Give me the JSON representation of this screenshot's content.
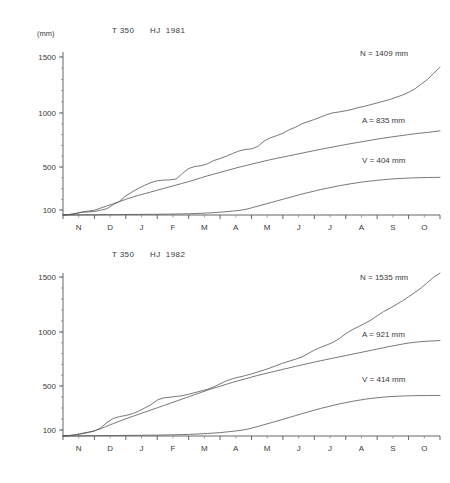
{
  "chart_data": [
    {
      "type": "line",
      "id": "hj-1981",
      "title": "T 350      HJ  1981",
      "title_parts": {
        "station": "T 350",
        "period": "HJ  1981"
      },
      "ylabel": "(mm)",
      "xlabel": "",
      "grid": false,
      "legend_position": "inline-right",
      "categories": [
        "N",
        "D",
        "J",
        "F",
        "M",
        "A",
        "M",
        "J",
        "J",
        "A",
        "S",
        "O"
      ],
      "ytick_labels": [
        "100",
        "500",
        "1000",
        "1500"
      ],
      "ytick_values": [
        100,
        500,
        1000,
        1500
      ],
      "ylim": [
        0,
        1600
      ],
      "annotations": [
        {
          "name": "N",
          "text": "N = 1409 mm",
          "value": 1409,
          "unit": "mm"
        },
        {
          "name": "A",
          "text": "A = 835 mm",
          "value": 835,
          "unit": "mm"
        },
        {
          "name": "V",
          "text": "V = 404 mm",
          "value": 404,
          "unit": "mm"
        }
      ],
      "series": [
        {
          "name": "N",
          "label": "N = 1409 mm",
          "final_value": 1409,
          "x": [
            0,
            0.2,
            0.4,
            0.6,
            0.8,
            1.0,
            1.2,
            1.4,
            1.6,
            1.8,
            2.0,
            2.2,
            2.4,
            2.6,
            2.8,
            3.0,
            3.2,
            3.4,
            3.6,
            3.8,
            4.0,
            4.2,
            4.4,
            4.6,
            4.8,
            5.0,
            5.2,
            5.4,
            5.6,
            5.8,
            6.0,
            6.2,
            6.4,
            6.6,
            6.8,
            7.0,
            7.2,
            7.4,
            7.6,
            7.8,
            8.0,
            8.2,
            8.4,
            8.6,
            8.8,
            9.0,
            9.2,
            9.4,
            9.6,
            9.8,
            10.0,
            10.2,
            10.4,
            10.6,
            10.8,
            11.0,
            11.2,
            11.4,
            11.6,
            11.8,
            12.0
          ],
          "values": [
            0,
            8,
            28,
            55,
            62,
            70,
            96,
            112,
            150,
            182,
            232,
            268,
            300,
            330,
            355,
            372,
            378,
            380,
            388,
            440,
            486,
            505,
            512,
            530,
            560,
            578,
            600,
            625,
            648,
            662,
            668,
            690,
            740,
            770,
            790,
            812,
            845,
            868,
            900,
            920,
            940,
            962,
            985,
            1002,
            1010,
            1020,
            1032,
            1048,
            1060,
            1075,
            1090,
            1105,
            1120,
            1140,
            1160,
            1185,
            1215,
            1258,
            1300,
            1355,
            1409
          ]
        },
        {
          "name": "A",
          "label": "A = 835 mm",
          "final_value": 835,
          "x": [
            0,
            0.2,
            0.4,
            0.6,
            0.8,
            1.0,
            1.2,
            1.4,
            1.6,
            1.8,
            2.0,
            2.2,
            2.4,
            2.6,
            2.8,
            3.0,
            3.2,
            3.4,
            3.6,
            3.8,
            4.0,
            4.2,
            4.4,
            4.6,
            4.8,
            5.0,
            5.2,
            5.4,
            5.6,
            5.8,
            6.0,
            6.2,
            6.4,
            6.6,
            6.8,
            7.0,
            7.2,
            7.4,
            7.6,
            7.8,
            8.0,
            8.2,
            8.4,
            8.6,
            8.8,
            9.0,
            9.2,
            9.4,
            9.6,
            9.8,
            10.0,
            10.2,
            10.4,
            10.6,
            10.8,
            11.0,
            11.2,
            11.4,
            11.6,
            11.8,
            12.0
          ],
          "values": [
            0,
            10,
            30,
            58,
            78,
            96,
            118,
            138,
            158,
            178,
            200,
            218,
            236,
            252,
            268,
            284,
            300,
            316,
            332,
            348,
            364,
            382,
            400,
            418,
            434,
            450,
            466,
            482,
            498,
            512,
            526,
            540,
            554,
            568,
            580,
            592,
            604,
            616,
            628,
            640,
            652,
            664,
            675,
            686,
            697,
            708,
            718,
            728,
            738,
            748,
            758,
            767,
            776,
            784,
            792,
            800,
            808,
            814,
            820,
            827,
            835
          ]
        },
        {
          "name": "V",
          "label": "V = 404 mm",
          "final_value": 404,
          "x": [
            0,
            0.2,
            0.4,
            0.6,
            0.8,
            1.0,
            1.2,
            1.4,
            1.6,
            1.8,
            2.0,
            2.2,
            2.4,
            2.6,
            2.8,
            3.0,
            3.2,
            3.4,
            3.6,
            3.8,
            4.0,
            4.2,
            4.4,
            4.6,
            4.8,
            5.0,
            5.2,
            5.4,
            5.6,
            5.8,
            6.0,
            6.2,
            6.4,
            6.6,
            6.8,
            7.0,
            7.2,
            7.4,
            7.6,
            7.8,
            8.0,
            8.2,
            8.4,
            8.6,
            8.8,
            9.0,
            9.2,
            9.4,
            9.6,
            9.8,
            10.0,
            10.2,
            10.4,
            10.6,
            10.8,
            11.0,
            11.2,
            11.4,
            11.6,
            11.8,
            12.0
          ],
          "values": [
            0,
            1,
            2,
            3,
            4,
            5,
            6,
            7,
            8,
            9,
            10,
            11,
            12,
            13,
            14,
            15,
            16,
            18,
            20,
            22,
            25,
            29,
            34,
            40,
            47,
            56,
            66,
            78,
            91,
            105,
            120,
            136,
            152,
            168,
            184,
            200,
            216,
            232,
            248,
            262,
            276,
            290,
            302,
            314,
            326,
            336,
            346,
            355,
            363,
            370,
            376,
            382,
            387,
            391,
            394,
            397,
            399,
            401,
            402,
            403,
            404
          ]
        }
      ]
    },
    {
      "type": "line",
      "id": "hj-1982",
      "title": "T 350      HJ  1982",
      "title_parts": {
        "station": "T 350",
        "period": "HJ  1982"
      },
      "ylabel": "(mm)",
      "xlabel": "",
      "grid": false,
      "legend_position": "inline-right",
      "categories": [
        "N",
        "D",
        "J",
        "F",
        "M",
        "A",
        "M",
        "J",
        "J",
        "A",
        "S",
        "O"
      ],
      "ytick_labels": [
        "100",
        "500",
        "1000",
        "1500"
      ],
      "ytick_values": [
        100,
        500,
        1000,
        1500
      ],
      "ylim": [
        0,
        1600
      ],
      "annotations": [
        {
          "name": "N",
          "text": "N = 1535 mm",
          "value": 1535,
          "unit": "mm"
        },
        {
          "name": "A",
          "text": "A = 921 mm",
          "value": 921,
          "unit": "mm"
        },
        {
          "name": "V",
          "text": "V = 414 mm",
          "value": 414,
          "unit": "mm"
        }
      ],
      "series": [
        {
          "name": "N",
          "label": "N = 1535 mm",
          "final_value": 1535,
          "x": [
            0,
            0.2,
            0.4,
            0.6,
            0.8,
            1.0,
            1.2,
            1.4,
            1.6,
            1.8,
            2.0,
            2.2,
            2.4,
            2.6,
            2.8,
            3.0,
            3.2,
            3.4,
            3.6,
            3.8,
            4.0,
            4.2,
            4.4,
            4.6,
            4.8,
            5.0,
            5.2,
            5.4,
            5.6,
            5.8,
            6.0,
            6.2,
            6.4,
            6.6,
            6.8,
            7.0,
            7.2,
            7.4,
            7.6,
            7.8,
            8.0,
            8.2,
            8.4,
            8.6,
            8.8,
            9.0,
            9.2,
            9.4,
            9.6,
            9.8,
            10.0,
            10.2,
            10.4,
            10.6,
            10.8,
            11.0,
            11.2,
            11.4,
            11.6,
            11.8,
            12.0
          ],
          "values": [
            0,
            6,
            18,
            38,
            58,
            82,
            118,
            170,
            205,
            222,
            232,
            248,
            270,
            300,
            330,
            372,
            392,
            398,
            405,
            412,
            425,
            440,
            455,
            470,
            492,
            520,
            548,
            568,
            582,
            596,
            612,
            630,
            648,
            668,
            690,
            712,
            730,
            748,
            768,
            800,
            832,
            858,
            880,
            905,
            940,
            985,
            1020,
            1048,
            1078,
            1108,
            1148,
            1185,
            1215,
            1248,
            1282,
            1320,
            1360,
            1400,
            1450,
            1498,
            1535
          ]
        },
        {
          "name": "A",
          "label": "A = 921 mm",
          "final_value": 921,
          "x": [
            0,
            0.2,
            0.4,
            0.6,
            0.8,
            1.0,
            1.2,
            1.4,
            1.6,
            1.8,
            2.0,
            2.2,
            2.4,
            2.6,
            2.8,
            3.0,
            3.2,
            3.4,
            3.6,
            3.8,
            4.0,
            4.2,
            4.4,
            4.6,
            4.8,
            5.0,
            5.2,
            5.4,
            5.6,
            5.8,
            6.0,
            6.2,
            6.4,
            6.6,
            6.8,
            7.0,
            7.2,
            7.4,
            7.6,
            7.8,
            8.0,
            8.2,
            8.4,
            8.6,
            8.8,
            9.0,
            9.2,
            9.4,
            9.6,
            9.8,
            10.0,
            10.2,
            10.4,
            10.6,
            10.8,
            11.0,
            11.2,
            11.4,
            11.6,
            11.8,
            12.0
          ],
          "values": [
            0,
            8,
            22,
            44,
            64,
            88,
            112,
            136,
            158,
            180,
            202,
            222,
            242,
            262,
            282,
            302,
            322,
            342,
            362,
            382,
            402,
            422,
            442,
            462,
            480,
            498,
            516,
            534,
            550,
            566,
            582,
            598,
            612,
            626,
            640,
            654,
            668,
            682,
            695,
            708,
            721,
            734,
            746,
            758,
            770,
            782,
            794,
            806,
            818,
            830,
            842,
            854,
            866,
            877,
            888,
            898,
            905,
            911,
            915,
            918,
            921
          ]
        },
        {
          "name": "V",
          "label": "V = 414 mm",
          "final_value": 414,
          "x": [
            0,
            0.2,
            0.4,
            0.6,
            0.8,
            1.0,
            1.2,
            1.4,
            1.6,
            1.8,
            2.0,
            2.2,
            2.4,
            2.6,
            2.8,
            3.0,
            3.2,
            3.4,
            3.6,
            3.8,
            4.0,
            4.2,
            4.4,
            4.6,
            4.8,
            5.0,
            5.2,
            5.4,
            5.6,
            5.8,
            6.0,
            6.2,
            6.4,
            6.6,
            6.8,
            7.0,
            7.2,
            7.4,
            7.6,
            7.8,
            8.0,
            8.2,
            8.4,
            8.6,
            8.8,
            9.0,
            9.2,
            9.4,
            9.6,
            9.8,
            10.0,
            10.2,
            10.4,
            10.6,
            10.8,
            11.0,
            11.2,
            11.4,
            11.6,
            11.8,
            12.0
          ],
          "values": [
            0,
            1,
            2,
            3,
            4,
            5,
            6,
            7,
            8,
            9,
            10,
            11,
            12,
            13,
            14,
            15,
            17,
            19,
            21,
            24,
            27,
            31,
            36,
            42,
            49,
            57,
            67,
            78,
            90,
            103,
            117,
            132,
            148,
            164,
            180,
            197,
            214,
            231,
            248,
            264,
            280,
            296,
            310,
            324,
            337,
            349,
            360,
            370,
            379,
            387,
            393,
            399,
            403,
            406,
            409,
            411,
            412,
            413,
            413,
            414,
            414
          ]
        }
      ]
    }
  ]
}
